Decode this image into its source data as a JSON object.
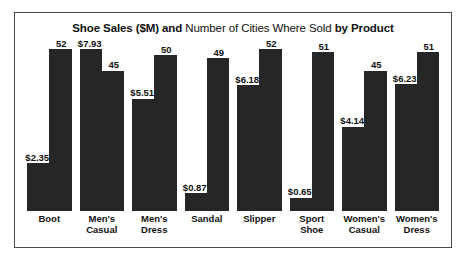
{
  "chart": {
    "title_parts": [
      {
        "text": "Shoe Sales ($M) ",
        "bold": true
      },
      {
        "text": "and ",
        "bold": true
      },
      {
        "text": "Number of Cities Where Sold ",
        "bold": false
      },
      {
        "text": "by Product",
        "bold": true
      }
    ],
    "title_full": "Shoe Sales ($M) and Number of Cities Where Sold by Product",
    "bar_color": "#262626",
    "border_color": "#4a4a4a",
    "background": "#ffffff"
  },
  "chart_data": {
    "type": "bar",
    "title": "Shoe Sales ($M) and Number of Cities Where Sold by Product",
    "xlabel": "",
    "ylabel": "",
    "grid": false,
    "legend": "none",
    "categories": [
      "Boot",
      "Men's Casual",
      "Men's Dress",
      "Sandal",
      "Slipper",
      "Sport Shoe",
      "Women's Casual",
      "Women's Dress"
    ],
    "category_lines": [
      [
        "Boot"
      ],
      [
        "Men's",
        "Casual"
      ],
      [
        "Men's",
        "Dress"
      ],
      [
        "Sandal"
      ],
      [
        "Slipper"
      ],
      [
        "Sport",
        "Shoe"
      ],
      [
        "Women's",
        "Casual"
      ],
      [
        "Women's",
        "Dress"
      ]
    ],
    "series": [
      {
        "name": "Shoe Sales ($M)",
        "axis": "left",
        "ylim": [
          0,
          8.1
        ],
        "values": [
          2.35,
          7.93,
          5.51,
          0.87,
          6.18,
          0.65,
          4.14,
          6.23
        ],
        "labels": [
          "$2.35",
          "$7.93",
          "$5.51",
          "$0.87",
          "$6.18",
          "$0.65",
          "$4.14",
          "$6.23"
        ]
      },
      {
        "name": "Number of Cities Where Sold",
        "axis": "right",
        "ylim": [
          0,
          53
        ],
        "values": [
          52,
          45,
          50,
          49,
          52,
          51,
          45,
          51
        ],
        "labels": [
          "52",
          "45",
          "50",
          "49",
          "52",
          "51",
          "45",
          "51"
        ]
      }
    ]
  }
}
